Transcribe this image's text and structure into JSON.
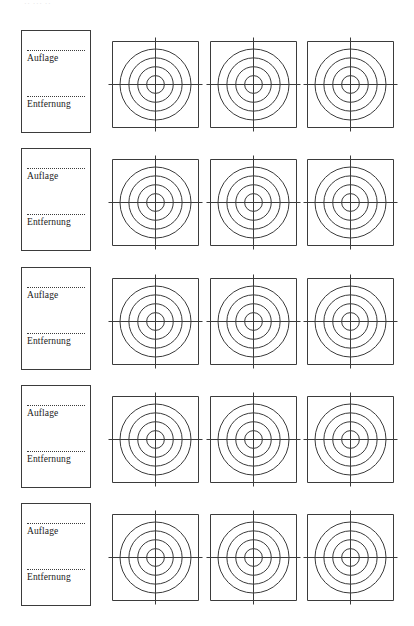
{
  "document": {
    "title": "Auflage / Entfernung Zielscheiben Formular",
    "scan_top_remnant": "··  ···          ··",
    "page_background": "#ffffff",
    "ink_color": "#3b3b3b",
    "text_color": "#1a1a1a"
  },
  "label_fields": {
    "auflage": "Auflage",
    "entfernung": "Entfernung"
  },
  "target": {
    "ring_count": 4,
    "has_crosshair": true,
    "shape": "square-with-concentric-circles"
  },
  "rows": [
    {
      "index": 1,
      "label_card": {
        "auflage": "Auflage",
        "entfernung": "Entfernung"
      },
      "targets": [
        {
          "index": 1,
          "rings": 4
        },
        {
          "index": 2,
          "rings": 4
        },
        {
          "index": 3,
          "rings": 4
        }
      ]
    },
    {
      "index": 2,
      "label_card": {
        "auflage": "Auflage",
        "entfernung": "Entfernung"
      },
      "targets": [
        {
          "index": 1,
          "rings": 4
        },
        {
          "index": 2,
          "rings": 4
        },
        {
          "index": 3,
          "rings": 4
        }
      ]
    },
    {
      "index": 3,
      "label_card": {
        "auflage": "Auflage",
        "entfernung": "Entfernung"
      },
      "targets": [
        {
          "index": 1,
          "rings": 4
        },
        {
          "index": 2,
          "rings": 4
        },
        {
          "index": 3,
          "rings": 4
        }
      ]
    },
    {
      "index": 4,
      "label_card": {
        "auflage": "Auflage",
        "entfernung": "Entfernung"
      },
      "targets": [
        {
          "index": 1,
          "rings": 4
        },
        {
          "index": 2,
          "rings": 4
        },
        {
          "index": 3,
          "rings": 4
        }
      ]
    },
    {
      "index": 5,
      "label_card": {
        "auflage": "Auflage",
        "entfernung": "Entfernung"
      },
      "targets": [
        {
          "index": 1,
          "rings": 4
        },
        {
          "index": 2,
          "rings": 4
        },
        {
          "index": 3,
          "rings": 4
        }
      ]
    }
  ],
  "layout": {
    "row_tops": [
      30,
      148,
      267,
      385,
      503
    ],
    "card_top_offsets": [
      0,
      0,
      0,
      0,
      0
    ],
    "target_top_offset": 11,
    "target_lefts": [
      112,
      210,
      307
    ],
    "target_size": 87,
    "card_left": 21,
    "card_width": 70,
    "card_height": 103
  }
}
